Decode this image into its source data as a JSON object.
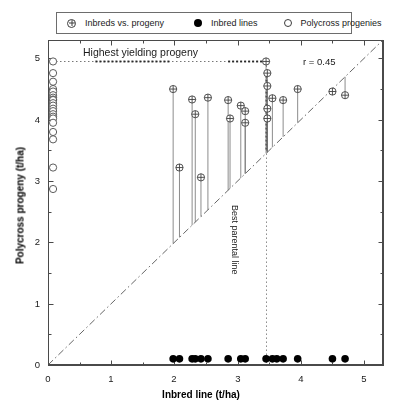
{
  "legend": {
    "items": [
      {
        "marker": "crossed-circle",
        "label": "Inbreds vs. progeny"
      },
      {
        "marker": "filled-circle",
        "label": "Inbred lines"
      },
      {
        "marker": "open-circle",
        "label": "Polycross progenies"
      }
    ]
  },
  "annotations": {
    "highest_yielding": "Highest yielding progeny",
    "correlation": "r = 0.45",
    "best_parental": "Best parental line"
  },
  "chart_data": {
    "type": "scatter",
    "title": "",
    "xlabel": "Inbred line (t/ha)",
    "ylabel": "Polycross progeny (t/ha)",
    "xlim": [
      0,
      5.3
    ],
    "ylim": [
      0,
      5.3
    ],
    "xticks": [
      0,
      1,
      2,
      3,
      4,
      5
    ],
    "yticks": [
      0,
      1,
      2,
      3,
      4,
      5
    ],
    "minor_ticks": [
      0.5,
      1.5,
      2.5,
      3.5,
      4.5
    ],
    "grid": false,
    "legend_position": "top",
    "reference_line": {
      "type": "identity",
      "style": "dash-dot",
      "from": [
        0,
        0
      ],
      "to": [
        5.3,
        5.3
      ]
    },
    "highest_progeny_level": 4.95,
    "best_parental_level": 3.45,
    "correlation_r": 0.45,
    "series": [
      {
        "name": "Inbreds vs. progeny",
        "marker": "crossed-circle",
        "note": "paired points with vertical stem dropping to the identity line",
        "points": [
          {
            "x": 1.98,
            "y": 4.5
          },
          {
            "x": 2.08,
            "y": 3.22
          },
          {
            "x": 2.28,
            "y": 4.33
          },
          {
            "x": 2.33,
            "y": 4.09
          },
          {
            "x": 2.42,
            "y": 3.06
          },
          {
            "x": 2.53,
            "y": 4.36
          },
          {
            "x": 2.85,
            "y": 4.32
          },
          {
            "x": 2.88,
            "y": 4.02
          },
          {
            "x": 3.05,
            "y": 4.23
          },
          {
            "x": 3.12,
            "y": 4.14
          },
          {
            "x": 3.12,
            "y": 3.95
          },
          {
            "x": 3.45,
            "y": 4.95
          },
          {
            "x": 3.47,
            "y": 4.76
          },
          {
            "x": 3.47,
            "y": 4.55
          },
          {
            "x": 3.47,
            "y": 4.18
          },
          {
            "x": 3.47,
            "y": 4.02
          },
          {
            "x": 3.55,
            "y": 4.35
          },
          {
            "x": 3.72,
            "y": 4.32
          },
          {
            "x": 3.95,
            "y": 4.5
          },
          {
            "x": 4.5,
            "y": 4.46
          },
          {
            "x": 4.7,
            "y": 4.4
          }
        ]
      },
      {
        "name": "Inbred lines",
        "marker": "filled-circle",
        "note": "plotted along y = 0.1 baseline",
        "y_baseline": 0.1,
        "x_values": [
          1.98,
          2.08,
          2.28,
          2.33,
          2.42,
          2.53,
          2.85,
          3.05,
          3.12,
          3.45,
          3.55,
          3.62,
          3.72,
          3.95,
          4.5,
          4.7
        ]
      },
      {
        "name": "Polycross progenies",
        "marker": "open-circle",
        "note": "plotted along x = 0.08 axis column",
        "x_baseline": 0.08,
        "y_values": [
          4.95,
          4.76,
          4.62,
          4.5,
          4.46,
          4.4,
          4.36,
          4.33,
          4.32,
          4.27,
          4.23,
          4.18,
          4.14,
          4.09,
          4.05,
          4.02,
          3.95,
          3.8,
          3.68,
          3.22,
          2.87
        ]
      }
    ]
  }
}
